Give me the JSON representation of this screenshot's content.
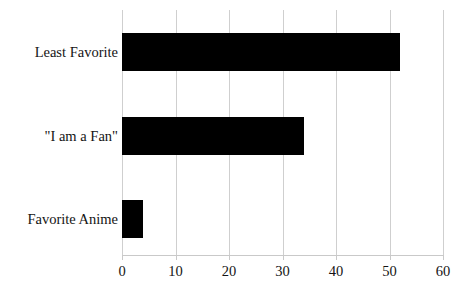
{
  "chart_data": {
    "type": "bar",
    "orientation": "horizontal",
    "title": "",
    "subtitle": "",
    "xlabel": "",
    "ylabel": "",
    "categories": [
      "Favorite Anime",
      "\"I am a Fan\"",
      "Least Favorite"
    ],
    "values": [
      4,
      34,
      52
    ],
    "series": [
      {
        "name": "",
        "values": [
          4,
          34,
          52
        ]
      }
    ],
    "xlim": [
      0,
      60
    ],
    "xticks": [
      0,
      10,
      20,
      30,
      40,
      50,
      60
    ],
    "xtick_labels": [
      "0",
      "10",
      "20",
      "30",
      "40",
      "50",
      "60"
    ],
    "grid": "vertical",
    "legend": "none",
    "bar_color": "#000000",
    "gridline_color": "#cfcfcf",
    "axis_color": "#c9c9c9",
    "background_color": "#ffffff",
    "annotations": []
  },
  "labels": {
    "category_top": "Least Favorite",
    "category_middle": "\"I am a Fan\"",
    "category_bottom": "Favorite Anime"
  },
  "ticks": {
    "t0": "0",
    "t1": "10",
    "t2": "20",
    "t3": "30",
    "t4": "40",
    "t5": "50",
    "t6": "60"
  }
}
